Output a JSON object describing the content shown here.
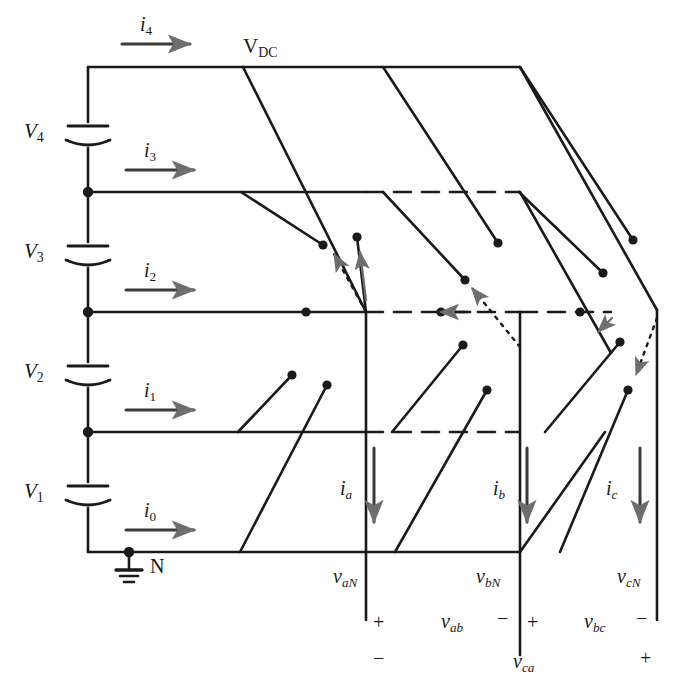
{
  "figure": {
    "title_text": "V",
    "dc_bus_label": "V",
    "dc_bus_sub": "DC",
    "neutral_label": "N"
  },
  "capacitors": [
    {
      "name": "V4",
      "label": "V",
      "sub": "4"
    },
    {
      "name": "V3",
      "label": "V",
      "sub": "3"
    },
    {
      "name": "V2",
      "label": "V",
      "sub": "2"
    },
    {
      "name": "V1",
      "label": "V",
      "sub": "1"
    }
  ],
  "rail_currents": [
    {
      "name": "i4",
      "label": "i",
      "sub": "4"
    },
    {
      "name": "i3",
      "label": "i",
      "sub": "3"
    },
    {
      "name": "i2",
      "label": "i",
      "sub": "2"
    },
    {
      "name": "i1",
      "label": "i",
      "sub": "1"
    },
    {
      "name": "i0",
      "label": "i",
      "sub": "0"
    }
  ],
  "phase_currents": [
    {
      "name": "ia",
      "label": "i",
      "sub": "a"
    },
    {
      "name": "ib",
      "label": "i",
      "sub": "b"
    },
    {
      "name": "ic",
      "label": "i",
      "sub": "c"
    }
  ],
  "phase_voltages": [
    {
      "name": "vaN",
      "label": "v",
      "sub": "aN"
    },
    {
      "name": "vbN",
      "label": "v",
      "sub": "bN"
    },
    {
      "name": "vcN",
      "label": "v",
      "sub": "cN"
    }
  ],
  "line_voltages": [
    {
      "name": "vab",
      "label": "v",
      "sub": "ab",
      "left_sign": "+",
      "right_sign": "−"
    },
    {
      "name": "vbc",
      "label": "v",
      "sub": "bc",
      "left_sign": "+",
      "right_sign": "−"
    },
    {
      "name": "vca",
      "label": "v",
      "sub": "ca",
      "left_sign": "−",
      "right_sign": "+"
    }
  ],
  "polarity_marks": [
    {
      "name": "a-plus",
      "text": "+"
    },
    {
      "name": "ab-minus",
      "text": "−"
    },
    {
      "name": "b-plus",
      "text": "+"
    },
    {
      "name": "bc-minus",
      "text": "−"
    },
    {
      "name": "a-minus",
      "text": "−"
    },
    {
      "name": "c-plus",
      "text": "+"
    }
  ],
  "colors": {
    "line": "#1a1a1a",
    "arrow_gray": "#6e6e6e",
    "background": "#ffffff"
  }
}
